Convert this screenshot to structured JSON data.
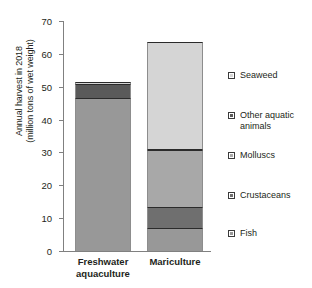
{
  "chart_data": {
    "type": "bar",
    "subtype": "stacked-bar",
    "title": "",
    "xlabel": "",
    "ylabel": "Annual harvest in 2018\n(million tons of wet weight)",
    "ylabel_line1": "Annual harvest in 2018",
    "ylabel_line2": "(million tons of wet weight)",
    "ylim": [
      0,
      70
    ],
    "yticks": [
      0,
      10,
      20,
      30,
      40,
      50,
      60,
      70
    ],
    "ytick_labels": [
      "0",
      "10",
      "20",
      "30",
      "40",
      "50",
      "60",
      "70"
    ],
    "grid": false,
    "legend_position": "right",
    "categories": [
      "Freshwater aquaculture",
      "Mariculture"
    ],
    "category_labels": [
      {
        "line1": "Freshwater",
        "line2": "aquaculture"
      },
      {
        "line1": "Mariculture",
        "line2": ""
      }
    ],
    "series": [
      {
        "name": "Fish",
        "values": [
          46.7,
          7.0
        ],
        "color": "#989898"
      },
      {
        "name": "Crustaceans",
        "values": [
          0.0,
          6.4
        ],
        "color": "#6f6f6f"
      },
      {
        "name": "Molluscs",
        "values": [
          0.0,
          17.4
        ],
        "color": "#a8a8a8"
      },
      {
        "name": "Other aquatic animals",
        "values": [
          4.2,
          0.3
        ],
        "color": "#5a5a5a"
      },
      {
        "name": "Seaweed",
        "values": [
          0.5,
          32.5
        ],
        "color": "#d5d5d5"
      }
    ],
    "totals": [
      51.4,
      63.6
    ],
    "legend_entries": [
      {
        "label": "Seaweed",
        "color": "#d5d5d5"
      },
      {
        "label": "Other aquatic\nanimals",
        "color": "#5a5a5a"
      },
      {
        "label": "Molluscs",
        "color": "#a8a8a8"
      },
      {
        "label": "Crustaceans",
        "color": "#6f6f6f"
      },
      {
        "label": "Fish",
        "color": "#989898"
      }
    ],
    "axis_color": "#808080",
    "segment_border_color": "#2b2b2b"
  }
}
